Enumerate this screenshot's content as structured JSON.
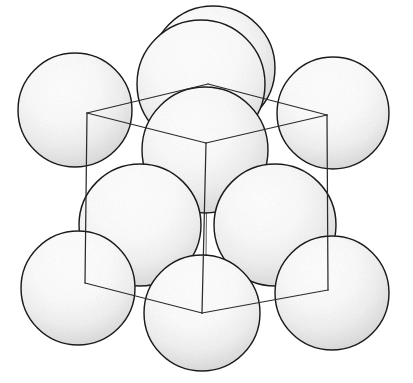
{
  "figure": {
    "kind": "crystal-lattice-illustration",
    "background_color": "#ffffff",
    "outline_color": "#1a1a1a",
    "cube_edge_color": "#2b2b2b",
    "cube_edge_hidden_color": "#6d6d6d",
    "sphere_fill_light": "#ffffff",
    "sphere_fill_mid": "#f2f2f2",
    "sphere_fill_shadow": "#c9c9c9",
    "canvas": {
      "width": 413,
      "height": 383
    },
    "caption": "",
    "labels": []
  },
  "cube": {
    "name": "unit-cell-wireframe",
    "vertices": {
      "front_top": {
        "x": 206,
        "y": 143
      },
      "left_top": {
        "x": 87,
        "y": 113
      },
      "right_top": {
        "x": 327,
        "y": 115
      },
      "back_top": {
        "x": 208,
        "y": 84
      },
      "front_bottom": {
        "x": 202,
        "y": 313
      },
      "left_bottom": {
        "x": 85,
        "y": 283
      },
      "right_bottom": {
        "x": 328,
        "y": 290
      },
      "back_bottom": {
        "x": 206,
        "y": 255
      }
    },
    "edges": [
      {
        "name": "front-top-to-left-top",
        "from": "front_top",
        "to": "left_top",
        "visible": true
      },
      {
        "name": "front-top-to-right-top",
        "from": "front_top",
        "to": "right_top",
        "visible": true
      },
      {
        "name": "front-top-to-front-bottom",
        "from": "front_top",
        "to": "front_bottom",
        "visible": true
      },
      {
        "name": "left-top-to-back-top",
        "from": "left_top",
        "to": "back_top",
        "visible": true
      },
      {
        "name": "right-top-to-back-top",
        "from": "right_top",
        "to": "back_top",
        "visible": true
      },
      {
        "name": "left-top-to-left-bottom",
        "from": "left_top",
        "to": "left_bottom",
        "visible": true
      },
      {
        "name": "right-top-to-right-bottom",
        "from": "right_top",
        "to": "right_bottom",
        "visible": true
      },
      {
        "name": "front-bottom-to-left-bottom",
        "from": "front_bottom",
        "to": "left_bottom",
        "visible": true
      },
      {
        "name": "front-bottom-to-right-bottom",
        "from": "front_bottom",
        "to": "right_bottom",
        "visible": true
      },
      {
        "name": "left-bottom-to-back-bottom",
        "from": "left_bottom",
        "to": "back_bottom",
        "visible": false
      },
      {
        "name": "right-bottom-to-back-bottom",
        "from": "right_bottom",
        "to": "back_bottom",
        "visible": false
      },
      {
        "name": "back-top-to-back-bottom",
        "from": "back_top",
        "to": "back_bottom",
        "visible": false
      }
    ]
  },
  "spheres": [
    {
      "name": "sphere-back-top-corner",
      "cx": 213,
      "cy": 68,
      "r": 62,
      "layer": 0,
      "site": "back-top-corner"
    },
    {
      "name": "sphere-top-face-center",
      "cx": 201,
      "cy": 84,
      "r": 64,
      "layer": 1,
      "site": "top-face-centre"
    },
    {
      "name": "sphere-corner-top-left",
      "cx": 75,
      "cy": 110,
      "r": 57,
      "layer": 2,
      "site": "corner"
    },
    {
      "name": "sphere-corner-top-right",
      "cx": 333,
      "cy": 113,
      "r": 56,
      "layer": 2,
      "site": "corner"
    },
    {
      "name": "sphere-front-face-center",
      "cx": 205,
      "cy": 150,
      "r": 63,
      "layer": 3,
      "site": "front-face-centre"
    },
    {
      "name": "sphere-left-face-center",
      "cx": 140,
      "cy": 225,
      "r": 61,
      "layer": 4,
      "site": "left-face-centre"
    },
    {
      "name": "sphere-right-face-center",
      "cx": 275,
      "cy": 225,
      "r": 61,
      "layer": 4,
      "site": "right-face-centre"
    },
    {
      "name": "sphere-corner-bottom-left",
      "cx": 78,
      "cy": 288,
      "r": 57,
      "layer": 5,
      "site": "corner"
    },
    {
      "name": "sphere-corner-bottom-right",
      "cx": 332,
      "cy": 293,
      "r": 57,
      "layer": 5,
      "site": "corner"
    },
    {
      "name": "sphere-bottom-face-center",
      "cx": 202,
      "cy": 313,
      "r": 58,
      "layer": 6,
      "site": "bottom-face-centre"
    }
  ]
}
